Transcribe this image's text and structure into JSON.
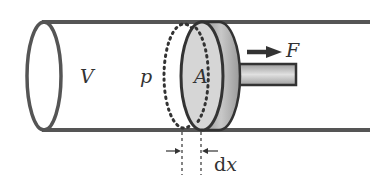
{
  "diagram": {
    "labels": {
      "volume": "V",
      "pressure": "p",
      "area": "A",
      "force": "F",
      "displacement_d": "d",
      "displacement_x": "x"
    },
    "colors": {
      "outline": "#4a4a4a",
      "piston_face": "#d6d6d6",
      "piston_rim": "#a8a8a8",
      "rod": "#bdbdbd",
      "arrow": "#333333"
    }
  }
}
